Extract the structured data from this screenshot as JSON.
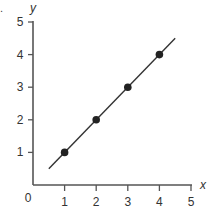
{
  "question_marker": ".",
  "chart_data": {
    "type": "line",
    "title": "",
    "xlabel": "x",
    "ylabel": "y",
    "xlim": [
      0,
      5
    ],
    "ylim": [
      0,
      5
    ],
    "grid": false,
    "legend": null,
    "x_ticks": [
      1,
      2,
      3,
      4,
      5
    ],
    "y_ticks": [
      1,
      2,
      3,
      4,
      5
    ],
    "origin_label": "0",
    "series": [
      {
        "name": "y = x",
        "line": {
          "x": [
            0.5,
            4.5
          ],
          "y": [
            0.5,
            4.5
          ]
        },
        "points": {
          "x": [
            1,
            2,
            3,
            4
          ],
          "y": [
            1,
            2,
            3,
            4
          ]
        },
        "color": "#333333",
        "marker": "filled-circle"
      }
    ]
  },
  "style": {
    "axis_color": "#555555",
    "line_color": "#333333",
    "point_color": "#222222"
  }
}
